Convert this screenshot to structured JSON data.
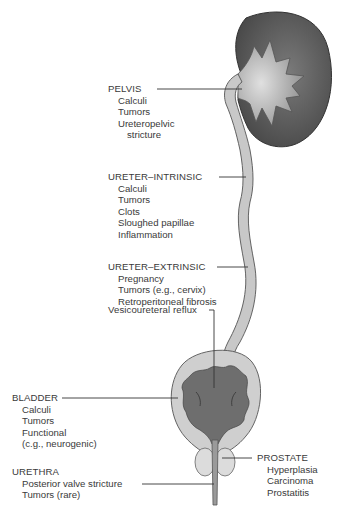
{
  "diagram": {
    "colors": {
      "kidney_cortex": "#5e5e5e",
      "kidney_inner": "#9a9a9a",
      "ureter_fill": "#c8c8c8",
      "bladder_wall": "#cfcfcf",
      "bladder_lumen": "#6e6e6e",
      "leader_line": "#333333",
      "text": "#3a3a3a"
    },
    "labels": {
      "pelvis": {
        "heading": "PELVIS",
        "items": [
          "Calculi",
          "Tumors",
          "Ureteropelvic",
          "stricture"
        ]
      },
      "ureter_intrinsic": {
        "heading": "URETER–INTRINSIC",
        "items": [
          "Calculi",
          "Tumors",
          "Clots",
          "Sloughed papillae",
          "Inflammation"
        ]
      },
      "ureter_extrinsic": {
        "heading": "URETER–EXTRINSIC",
        "items": [
          "Pregnancy",
          "Tumors (e.g., cervix)",
          "Retroperitoneal fibrosis"
        ]
      },
      "vesicoureteral": {
        "heading": "Vesicoureteral reflux"
      },
      "bladder": {
        "heading": "BLADDER",
        "items": [
          "Calculi",
          "Tumors",
          "Functional",
          "(c.g., neurogenic)"
        ]
      },
      "urethra": {
        "heading": "URETHRA",
        "items": [
          "Posterior valve stricture",
          "Tumors (rare)"
        ]
      },
      "prostate": {
        "heading": "PROSTATE",
        "items": [
          "Hyperplasia",
          "Carcinoma",
          "Prostatitis"
        ]
      }
    }
  }
}
